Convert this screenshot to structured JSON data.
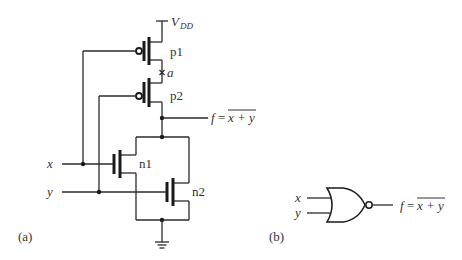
{
  "figure": {
    "panel_a": {
      "label": "(a)",
      "supply": {
        "name": "V",
        "subscript": "DD"
      },
      "node_a": "a",
      "transistors": [
        {
          "name": "p1",
          "type": "pmos"
        },
        {
          "name": "p2",
          "type": "pmos"
        },
        {
          "name": "n1",
          "type": "nmos"
        },
        {
          "name": "n2",
          "type": "nmos"
        }
      ],
      "inputs": [
        "x",
        "y"
      ],
      "output": {
        "lhs": "f",
        "eq": "=",
        "expr": "x + y"
      }
    },
    "panel_b": {
      "label": "(b)",
      "gate": "NOR",
      "inputs": [
        "x",
        "y"
      ],
      "output": {
        "lhs": "f",
        "eq": "=",
        "expr": "x + y"
      }
    }
  }
}
